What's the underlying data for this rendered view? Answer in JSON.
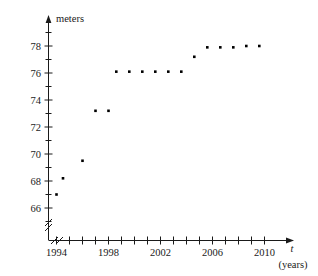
{
  "chart_data": {
    "type": "scatter",
    "title": "",
    "xlabel": "t",
    "xlabel_unit": "(years)",
    "ylabel": "meters",
    "xlim": [
      1992.6,
      2011.6
    ],
    "ylim": [
      65.0,
      79.2
    ],
    "grid": false,
    "legend": "none",
    "axis_break_x": true,
    "axis_break_y": true,
    "x_tick_step_years": 1,
    "x_tick_labels": [
      "1994",
      "1998",
      "2002",
      "2006",
      "2010"
    ],
    "x_tick_label_values": [
      1994,
      1998,
      2002,
      2006,
      2010
    ],
    "y_tick_labels": [
      "66",
      "68",
      "70",
      "72",
      "74",
      "76",
      "78"
    ],
    "y_tick_label_values": [
      66,
      68,
      70,
      72,
      74,
      76,
      78
    ],
    "y_minor_tick_values": [
      65,
      67,
      69,
      71,
      73,
      75,
      77,
      79
    ],
    "x": [
      1994,
      1994.5,
      1996,
      1997,
      1998,
      1998.6,
      1999.6,
      2000.6,
      2001.6,
      2002.6,
      2003.6,
      2004.6,
      2005.6,
      2006.6,
      2007.6,
      2008.6,
      2009.6
    ],
    "values": [
      67.0,
      68.2,
      69.5,
      73.2,
      73.2,
      76.1,
      76.1,
      76.1,
      76.1,
      76.1,
      76.1,
      77.2,
      77.9,
      77.9,
      77.9,
      78.0,
      78.0
    ],
    "points": [
      {
        "x": 1994.0,
        "y": 67.0
      },
      {
        "x": 1994.5,
        "y": 68.2
      },
      {
        "x": 1996.0,
        "y": 69.5
      },
      {
        "x": 1997.0,
        "y": 73.2
      },
      {
        "x": 1998.0,
        "y": 73.2
      },
      {
        "x": 1998.6,
        "y": 76.1
      },
      {
        "x": 1999.6,
        "y": 76.1
      },
      {
        "x": 2000.6,
        "y": 76.1
      },
      {
        "x": 2001.6,
        "y": 76.1
      },
      {
        "x": 2002.6,
        "y": 76.1
      },
      {
        "x": 2003.6,
        "y": 76.1
      },
      {
        "x": 2004.6,
        "y": 77.2
      },
      {
        "x": 2005.6,
        "y": 77.9
      },
      {
        "x": 2006.6,
        "y": 77.9
      },
      {
        "x": 2007.6,
        "y": 77.9
      },
      {
        "x": 2008.6,
        "y": 78.0
      },
      {
        "x": 2009.6,
        "y": 78.0
      }
    ],
    "marker": {
      "shape": "square-dot",
      "size_px": 2.6,
      "color": "#000000"
    }
  },
  "axes": {
    "y_axis_caption": "meters",
    "x_axis_symbol": "t",
    "x_axis_unit": "(years)"
  }
}
